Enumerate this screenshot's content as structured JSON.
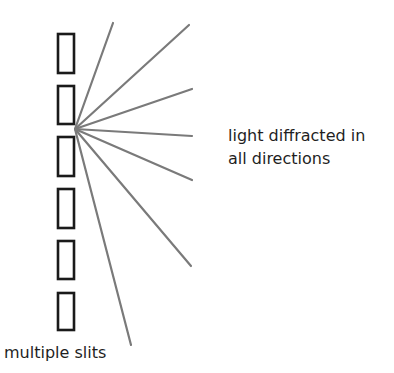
{
  "diagram": {
    "labels": {
      "diffracted_line1": "light diffracted in",
      "diffracted_line2": "all directions",
      "slits": "multiple slits"
    },
    "colors": {
      "slit_stroke": "#1a1a1a",
      "ray_stroke": "#7a7a7a",
      "text": "#1f1f1f",
      "background": "#ffffff"
    },
    "slits": [
      {
        "x": 58,
        "y": 34,
        "width": 16,
        "height": 39
      },
      {
        "x": 58,
        "y": 86,
        "width": 16,
        "height": 38
      },
      {
        "x": 58,
        "y": 137,
        "width": 16,
        "height": 39
      },
      {
        "x": 58,
        "y": 189,
        "width": 16,
        "height": 39
      },
      {
        "x": 58,
        "y": 241,
        "width": 16,
        "height": 38
      },
      {
        "x": 58,
        "y": 293,
        "width": 16,
        "height": 37
      }
    ],
    "ray_origin": {
      "x": 75,
      "y": 129
    },
    "rays": [
      {
        "x2": 113,
        "y2": 23
      },
      {
        "x2": 189,
        "y2": 25
      },
      {
        "x2": 192,
        "y2": 89
      },
      {
        "x2": 192,
        "y2": 136
      },
      {
        "x2": 192,
        "y2": 180
      },
      {
        "x2": 191,
        "y2": 266
      },
      {
        "x2": 131,
        "y2": 345
      }
    ]
  }
}
